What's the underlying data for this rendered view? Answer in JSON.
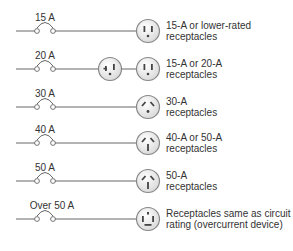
{
  "rows": [
    {
      "rating": "15 A",
      "description": "15-A or lower-rated receptacles",
      "line1": "15-A or lower-rated",
      "line2": "receptacles",
      "receptacles": [
        "15A"
      ]
    },
    {
      "rating": "20 A",
      "description": "15-A or 20-A receptacles",
      "line1": "15-A or 20-A",
      "line2": "receptacles",
      "receptacles": [
        "20A",
        "15A"
      ]
    },
    {
      "rating": "30 A",
      "description": "30-A receptacles",
      "line1": "30-A",
      "line2": "receptacles",
      "receptacles": [
        "30A"
      ]
    },
    {
      "rating": "40 A",
      "description": "40-A or 50-A receptacles",
      "line1": "40-A or 50-A",
      "line2": "receptacles",
      "receptacles": [
        "50A"
      ]
    },
    {
      "rating": "50 A",
      "description": "50-A receptacles",
      "line1": "50-A",
      "line2": "receptacles",
      "receptacles": [
        "50A"
      ]
    },
    {
      "rating": "Over 50 A",
      "description": "Receptacles same as circuit rating (overcurrent device)",
      "line1": "Receptacles same as circuit",
      "line2": "rating (overcurrent device)",
      "receptacles": [
        "over50A"
      ]
    }
  ],
  "colors": {
    "line": "#555555",
    "receptacle_fill": "#eeeeee",
    "receptacle_stroke": "#888888",
    "slot": "#444444"
  }
}
